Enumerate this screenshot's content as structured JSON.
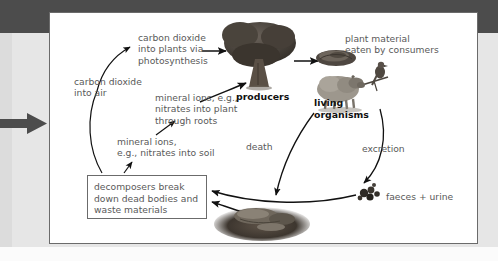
{
  "page": {
    "background_color": "#e6e6e6",
    "top_band_color": "#4c4c4c",
    "panel_background": "#ffffff",
    "panel_border_color": "#6b6b6b",
    "text_color": "#595959",
    "bold_text_color": "#111111",
    "arrow_color": "#4c4c4c"
  },
  "diagram": {
    "labels": {
      "co2_into_plants": "carbon dioxide\ninto plants via\nphotosynthesis",
      "co2_into_air": "carbon dioxide\ninto air",
      "mineral_ions_into_plant": "mineral ions, e.g.,\nnitrates into plant\nthrough roots",
      "mineral_ions_into_soil": "mineral ions,\ne.g., nitrates into soil",
      "plant_material_eaten": "plant material\neaten by consumers",
      "producers": "producers",
      "living_organisms": "living\norganisms",
      "death": "death",
      "excretion": "excretion",
      "faeces_and_urine": "faeces + urine",
      "decomposers_box": "decomposers break\ndown dead bodies and\nwaste materials"
    },
    "pictures": [
      {
        "name": "tree-producer-image",
        "caption": "producers"
      },
      {
        "name": "grass-clump-image",
        "caption": "plant material eaten by consumers"
      },
      {
        "name": "sheep-and-bird-image",
        "caption": "living organisms"
      },
      {
        "name": "faeces-image",
        "caption": "faeces + urine"
      },
      {
        "name": "dead-animal-carcass-image",
        "caption": "dead bodies"
      }
    ],
    "flow_arrows": [
      {
        "name": "co2-to-tree-arrow",
        "from": "carbon dioxide into plants via photosynthesis",
        "to": "producers"
      },
      {
        "name": "minerals-to-tree-arrow",
        "from": "mineral ions, e.g., nitrates into plant through roots",
        "to": "producers"
      },
      {
        "name": "tree-to-grass-arrow",
        "from": "producers",
        "to": "plant material eaten by consumers"
      },
      {
        "name": "death-arrow",
        "from": "living organisms",
        "to": "dead bodies"
      },
      {
        "name": "excretion-arrow",
        "from": "living organisms",
        "to": "faeces + urine"
      },
      {
        "name": "faeces-to-decomposers-arrow",
        "from": "faeces + urine",
        "to": "decomposers"
      },
      {
        "name": "carcass-to-decomposers-arrow",
        "from": "dead bodies",
        "to": "decomposers"
      },
      {
        "name": "decomposers-to-co2-arrow",
        "from": "decomposers",
        "to": "carbon dioxide into air"
      },
      {
        "name": "decomposers-to-minerals-arrow",
        "from": "decomposers",
        "to": "mineral ions into soil"
      },
      {
        "name": "soil-minerals-to-roots-arrow",
        "from": "mineral ions into soil",
        "to": "mineral ions into plant through roots"
      }
    ]
  }
}
